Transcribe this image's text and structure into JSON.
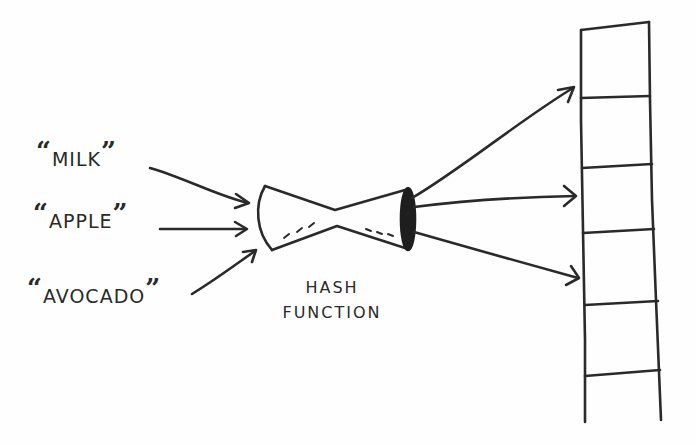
{
  "diagram": {
    "inputs": [
      {
        "label": "MILK"
      },
      {
        "label": "APPLE"
      },
      {
        "label": "AVOCADO"
      }
    ],
    "quote_open": "“",
    "quote_close": "”",
    "hash_function": {
      "line1": "HASH",
      "line2": "FUNCTION"
    },
    "array": {
      "slot_count": 6
    },
    "colors": {
      "ink": "#2a2a2a",
      "background": "#fefefe"
    }
  }
}
